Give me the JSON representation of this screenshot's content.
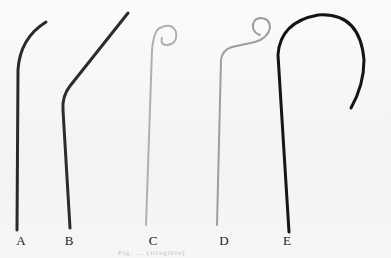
{
  "figure": {
    "labels": [
      "A",
      "B",
      "C",
      "D",
      "E"
    ],
    "caption": "Fig. ... (illegible)",
    "colors": {
      "background": "#f7f7f7",
      "catheter_dark": "#1e1e1e",
      "catheter_light": "#a8a8a8",
      "label": "#222222"
    }
  }
}
